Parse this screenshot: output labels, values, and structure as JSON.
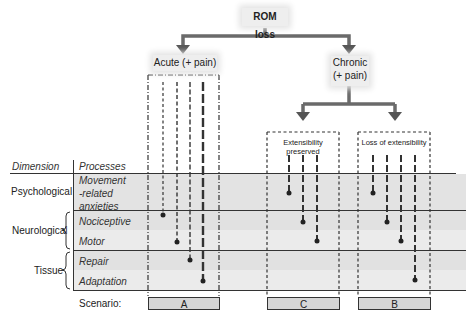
{
  "title": "ROM loss",
  "branches": {
    "acute": "Acute (+ pain)",
    "chronic_line1": "Chronic",
    "chronic_line2": "(+ pain)",
    "extensibility_preserved": "Extensibility preserved",
    "loss_of_extensibility": "Loss of extensibility"
  },
  "headers": {
    "dimension": "Dimension",
    "processes": "Processes"
  },
  "dimensions": [
    {
      "label": "Psychological",
      "processes": [
        "Movement",
        "-related",
        "anxieties"
      ]
    },
    {
      "label": "Neurological",
      "processes": [
        "Nociceptive",
        "Motor"
      ]
    },
    {
      "label": "Tissue",
      "processes": [
        "Repair",
        "Adaptation"
      ]
    }
  ],
  "scenario_label": "Scenario:",
  "scenarios": [
    "A",
    "C",
    "B"
  ],
  "colors": {
    "band_dark": "#e2e2e2",
    "band_light": "#ececec",
    "arrow": "#666666"
  }
}
